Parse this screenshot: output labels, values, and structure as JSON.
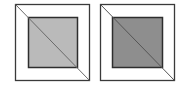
{
  "diagram": {
    "panels": [
      {
        "name": "left-panel",
        "outer": {
          "x": 15.5,
          "y": 4.5,
          "w": 74,
          "h": 76,
          "stroke": "#3a3a3a",
          "fill": "#ffffff"
        },
        "inner": {
          "x": 28.5,
          "y": 17.5,
          "w": 49,
          "h": 50,
          "stroke": "#2e2e2e",
          "fill": "#bababa"
        },
        "diagonal": {
          "x1": 15.5,
          "y1": 4.5,
          "x2": 89.5,
          "y2": 80.5,
          "stroke": "#6a6a6a"
        }
      },
      {
        "name": "right-panel",
        "outer": {
          "x": 100.5,
          "y": 4.5,
          "w": 74,
          "h": 76,
          "stroke": "#3a3a3a",
          "fill": "#ffffff"
        },
        "inner": {
          "x": 112.5,
          "y": 17.5,
          "w": 50,
          "h": 50,
          "stroke": "#2e2e2e",
          "fill": "#8e8e8e"
        },
        "diagonal": {
          "x1": 100.5,
          "y1": 4.5,
          "x2": 174.5,
          "y2": 80.5,
          "stroke": "#555555"
        }
      }
    ]
  }
}
